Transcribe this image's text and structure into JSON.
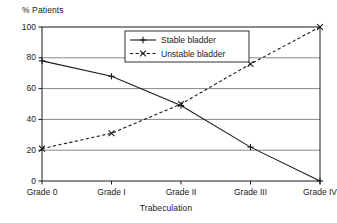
{
  "chart_data": {
    "type": "line",
    "title": "",
    "subtitle": "",
    "xlabel": "Trabeculation",
    "ylabel": "% Patients",
    "categories": [
      "Grade 0",
      "Grade I",
      "Grade II",
      "Grade III",
      "Grade IV"
    ],
    "ylim": [
      0,
      100
    ],
    "yticks": [
      "0",
      "20",
      "40",
      "60",
      "80",
      "100"
    ],
    "ytick_values": [
      0,
      20,
      40,
      60,
      80,
      100
    ],
    "grid": "horizontal",
    "legend_position": "top-center-right-inside",
    "series": [
      {
        "name": "Stable bladder",
        "values": [
          78,
          68,
          49,
          22,
          0
        ],
        "line_style": "solid",
        "marker": "plus",
        "color": "#1a1a1a"
      },
      {
        "name": "Unstable bladder",
        "values": [
          21,
          31,
          50,
          76,
          100
        ],
        "line_style": "dashed",
        "marker": "cross",
        "color": "#1a1a1a"
      }
    ]
  },
  "axes": {
    "y_axis_label": "% Patients",
    "x_axis_label": "Trabeculation"
  },
  "legend": {
    "entries": [
      {
        "label": "Stable bladder"
      },
      {
        "label": "Unstable bladder"
      }
    ]
  },
  "colors": {
    "foreground": "#1a1a1a",
    "grid": "#555555",
    "frame": "#1a1a1a",
    "background": "#ffffff"
  }
}
